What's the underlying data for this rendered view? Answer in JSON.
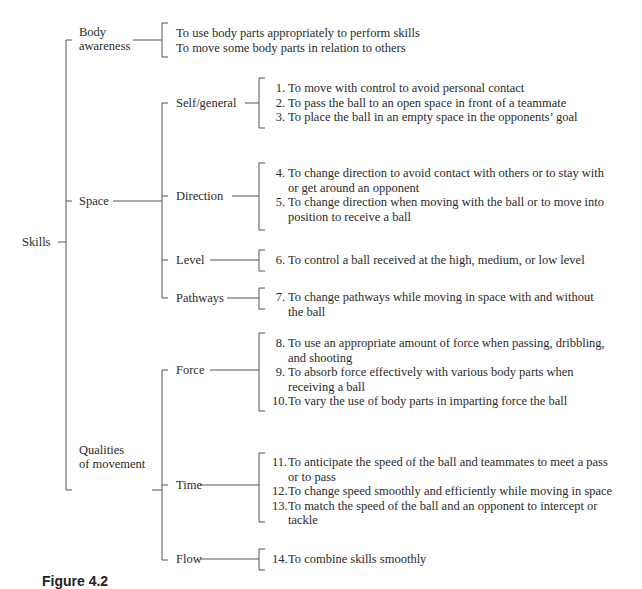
{
  "root": {
    "label": "Skills"
  },
  "categories": [
    {
      "label": "Body awareness",
      "label_lines": [
        "Body",
        "awareness"
      ],
      "items": [
        {
          "num": "",
          "text": "To use body parts appropriately to perform skills"
        },
        {
          "num": "",
          "text": "To move some body parts in relation to others"
        }
      ]
    },
    {
      "label": "Space",
      "subcategories": [
        {
          "label": "Self/general",
          "items": [
            {
              "num": "1.",
              "text": "To move with control to avoid personal contact"
            },
            {
              "num": "2.",
              "text": "To pass the ball to an open space in front of a teammate"
            },
            {
              "num": "3.",
              "text": "To place the ball in an empty space in the opponents’ goal"
            }
          ]
        },
        {
          "label": "Direction",
          "items": [
            {
              "num": "4.",
              "text": "To change direction to avoid contact with others or to stay with or get around an opponent",
              "lines": [
                "To change direction to avoid contact with others or to stay with",
                "or get around an opponent"
              ]
            },
            {
              "num": "5.",
              "text": "To change direction when moving with the ball or to move into position to receive a ball",
              "lines": [
                "To change direction when moving with the ball or to move into",
                "position to receive a ball"
              ]
            }
          ]
        },
        {
          "label": "Level",
          "items": [
            {
              "num": "6.",
              "text": "To control a ball received at the high, medium, or low level"
            }
          ]
        },
        {
          "label": "Pathways",
          "items": [
            {
              "num": "7.",
              "text": "To change pathways while moving in space with and without the ball",
              "lines": [
                "To change pathways while moving in space with and without",
                "the ball"
              ]
            }
          ]
        }
      ]
    },
    {
      "label": "Qualities of movement",
      "label_lines": [
        "Qualities",
        "of movement"
      ],
      "subcategories": [
        {
          "label": "Force",
          "items": [
            {
              "num": "8.",
              "text": "To use an appropriate amount of force when passing, dribbling, and shooting",
              "lines": [
                "To use an appropriate amount of force when passing, dribbling,",
                "and shooting"
              ]
            },
            {
              "num": "9.",
              "text": "To absorb force effectively with various body parts when receiving a ball",
              "lines": [
                "To absorb force effectively with various body parts when",
                "receiving a ball"
              ]
            },
            {
              "num": "10.",
              "text": "To vary the use of body parts in imparting force the ball"
            }
          ]
        },
        {
          "label": "Time",
          "items": [
            {
              "num": "11.",
              "text": "To anticipate the speed of the ball and teammates to meet a pass or to pass",
              "lines": [
                "To anticipate the speed of the ball and teammates to meet a pass",
                "or to pass"
              ]
            },
            {
              "num": "12.",
              "text": "To change speed smoothly and efficiently while moving in space"
            },
            {
              "num": "13.",
              "text": "To match the speed of the ball and an opponent to intercept or tackle",
              "lines": [
                "To match the speed of the ball and an opponent to intercept or",
                "tackle"
              ]
            }
          ]
        },
        {
          "label": "Flow",
          "items": [
            {
              "num": "14.",
              "text": "To combine skills smoothly"
            }
          ]
        }
      ]
    }
  ],
  "caption": "Figure 4.2"
}
